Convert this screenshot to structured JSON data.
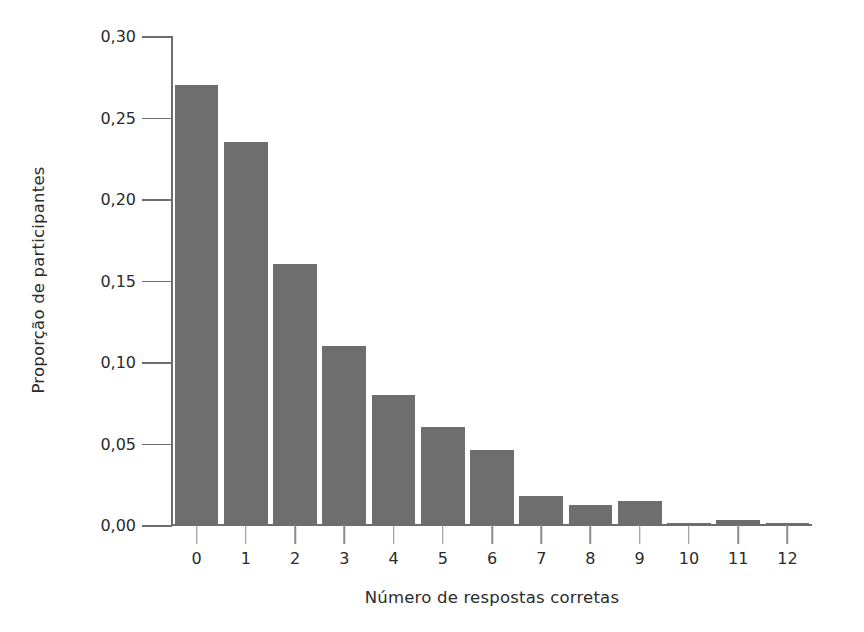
{
  "chart_data": {
    "type": "bar",
    "title": "",
    "xlabel": "Número de respostas corretas",
    "ylabel": "Proporção de participantes",
    "categories": [
      "0",
      "1",
      "2",
      "3",
      "4",
      "5",
      "6",
      "7",
      "8",
      "9",
      "10",
      "11",
      "12"
    ],
    "values": [
      0.27,
      0.235,
      0.16,
      0.11,
      0.08,
      0.06,
      0.046,
      0.018,
      0.012,
      0.015,
      0.001,
      0.003,
      0.001
    ],
    "ylim": [
      0.0,
      0.3
    ],
    "ytick_values": [
      0.0,
      0.05,
      0.1,
      0.15,
      0.2,
      0.25,
      0.3
    ],
    "ytick_labels": [
      "0,00",
      "0,05",
      "0,10",
      "0,15",
      "0,20",
      "0,25",
      "0,30"
    ],
    "xtick_labels": [
      "0",
      "1",
      "2",
      "3",
      "4",
      "5",
      "6",
      "7",
      "8",
      "9",
      "10",
      "11",
      "12"
    ],
    "grid": false,
    "legend": null,
    "bar_color": "#6e6e6e",
    "axis_color": "#6d6d6d",
    "background_color": "#ffffff",
    "decimal_separator": ","
  }
}
